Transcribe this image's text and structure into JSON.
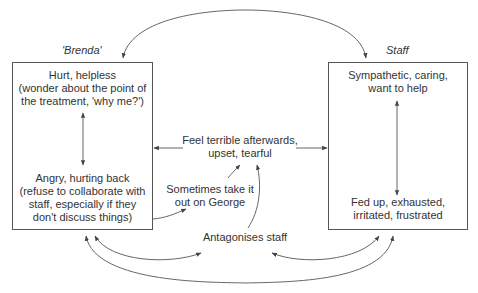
{
  "diagram": {
    "type": "cycle-of-emotions",
    "colors": {
      "line": "#555555",
      "text": "#333333",
      "background": "#ffffff"
    },
    "left_column": {
      "heading": "'Brenda'",
      "top_state": "Hurt, helpless\n(wonder about the point of\nthe treatment, 'why me?')",
      "bottom_state": "Angry, hurting back\n(refuse to collaborate with\nstaff, especially if they\ndon't discuss things)"
    },
    "right_column": {
      "heading": "Staff",
      "top_state": "Sympathetic, caring,\nwant to help",
      "bottom_state": "Fed up, exhausted,\nirritated, frustrated"
    },
    "middle": {
      "feel_terrible": "Feel terrible afterwards,\nupset, tearful",
      "take_out": "Sometimes take it\nout on George",
      "antagonises": "Antagonises staff"
    },
    "edges": [
      {
        "from": "Brenda box",
        "to": "Staff box",
        "kind": "bidirectional-arc-top"
      },
      {
        "from": "Hurt, helpless",
        "to": "Angry, hurting back",
        "kind": "bidirectional"
      },
      {
        "from": "Sympathetic, caring",
        "to": "Fed up, exhausted",
        "kind": "bidirectional"
      },
      {
        "from": "Feel terrible afterwards",
        "to": "Brenda box",
        "kind": "arrow"
      },
      {
        "from": "Feel terrible afterwards",
        "to": "Staff box",
        "kind": "arrow"
      },
      {
        "from": "Angry, hurting back",
        "to": "Sometimes take it out on George",
        "kind": "arrow"
      },
      {
        "from": "Sometimes take it out on George",
        "to": "Feel terrible afterwards",
        "kind": "arrow"
      },
      {
        "from": "Antagonises staff",
        "to": "Feel terrible afterwards",
        "kind": "arrow"
      },
      {
        "from": "Brenda box",
        "to": "Antagonises staff",
        "kind": "bidirectional-arc"
      },
      {
        "from": "Staff box",
        "to": "Antagonises staff",
        "kind": "bidirectional-arc"
      },
      {
        "from": "Brenda box",
        "to": "Staff box",
        "kind": "bidirectional-arc-bottom"
      }
    ]
  }
}
